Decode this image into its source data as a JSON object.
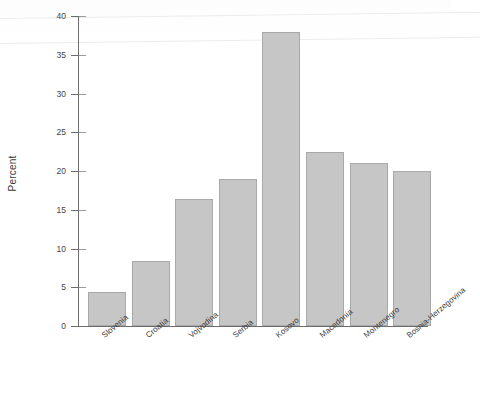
{
  "chart_data": {
    "type": "bar",
    "title": "",
    "subtitle": "",
    "xlabel": "",
    "ylabel": "Percent",
    "ylim": [
      0,
      40
    ],
    "yticks": [
      0,
      5,
      10,
      15,
      20,
      25,
      30,
      35,
      40
    ],
    "ytick_labels": [
      "0",
      "5",
      "10",
      "15",
      "20",
      "25",
      "30",
      "35",
      "40"
    ],
    "grid": false,
    "legend": null,
    "bar_color": "#c6c6c6",
    "bar_edge_color": "#a9a9a9",
    "categories": [
      "Slovenia",
      "Croatia",
      "Vojvodina",
      "Serbia",
      "Kosovo",
      "Macedonia",
      "Montenegro",
      "Bosnia-Herzegovina"
    ],
    "values": [
      4.4,
      8.4,
      16.4,
      19.0,
      38.0,
      22.5,
      21.0,
      20.0
    ]
  },
  "caption": {
    "text": ""
  }
}
